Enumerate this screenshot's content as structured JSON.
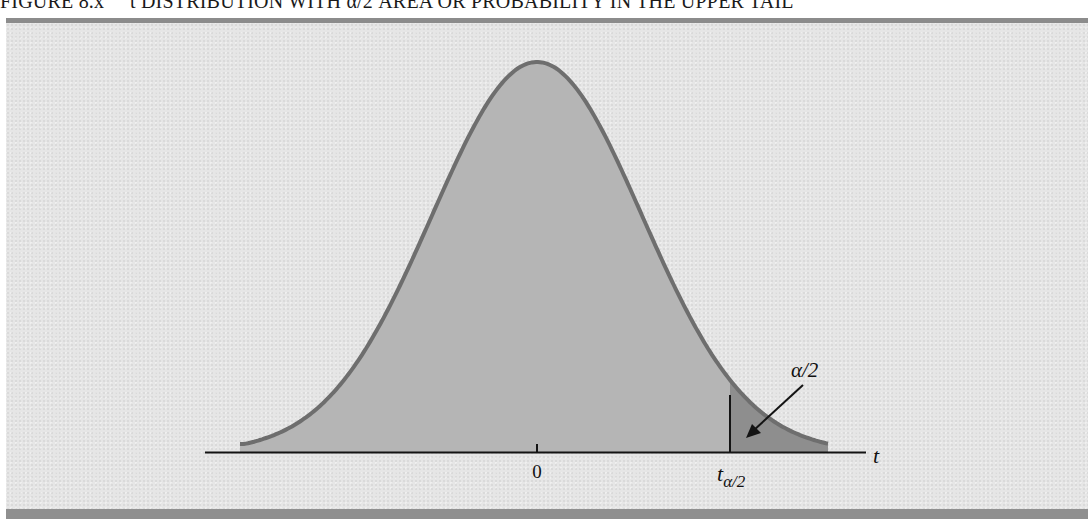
{
  "caption": {
    "figure_number": "FIGURE 8.x",
    "title": "t DISTRIBUTION WITH α/2 AREA OR PROBABILITY IN THE UPPER TAIL"
  },
  "chart_data": {
    "type": "area",
    "title": "t distribution with α/2 area or probability in the upper tail",
    "xlabel": "t",
    "ylabel": "",
    "x_tick_labels": [
      "0",
      "tα/2"
    ],
    "annotations": [
      {
        "text": "α/2",
        "points_to": "shaded upper tail area beyond tα/2"
      }
    ],
    "curve": "symmetric bell-shaped t density centered at 0",
    "shaded_region": {
      "from": "tα/2",
      "to": "+∞",
      "meaning": "upper tail area = α/2"
    },
    "grid": false,
    "legend": null,
    "colors": {
      "body_fill": "#b5b5b5",
      "tail_fill": "#8e8e8e",
      "curve_stroke": "#6e6e6e",
      "axis": "#141414",
      "panel_bg": "#e6e6e6"
    }
  },
  "labels": {
    "zero": "0",
    "t_axis": "t",
    "t_crit_main": "t",
    "t_crit_sub": "α/2",
    "alpha_half": "α/2"
  }
}
